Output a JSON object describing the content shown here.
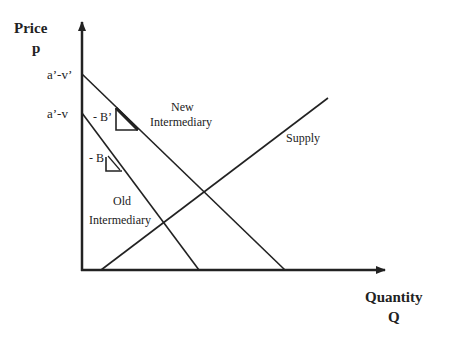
{
  "axes": {
    "y_title": "Price",
    "y_symbol": "p",
    "x_title": "Quantity",
    "x_symbol": "Q",
    "y_ticks": [
      "a’-v’",
      "a’-v"
    ]
  },
  "curves": {
    "new_demand": {
      "label_line1": "New",
      "label_line2": "Intermediary",
      "slope_label": "- B’"
    },
    "old_demand": {
      "label_line1": "Old",
      "label_line2": "Intermediary",
      "slope_label": "- B"
    },
    "supply": {
      "label": "Supply"
    }
  },
  "colors": {
    "line": "#222222",
    "background": "#ffffff"
  }
}
